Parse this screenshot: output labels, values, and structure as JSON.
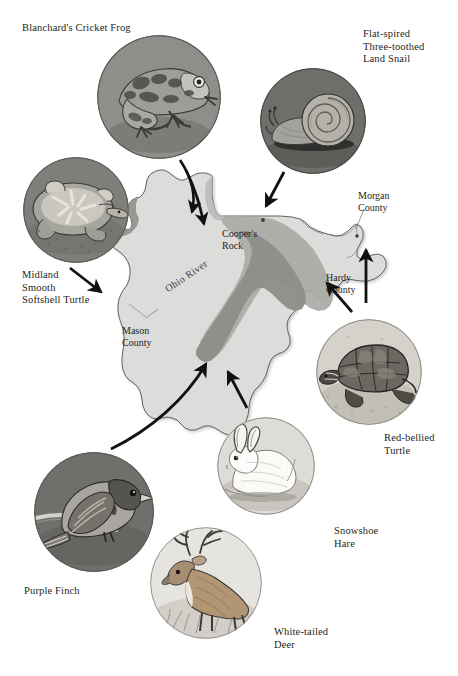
{
  "figure": {
    "background": "#ffffff",
    "width": 458,
    "height": 676
  },
  "map": {
    "name": "West Virginia",
    "fill_lowland": "#dcdcda",
    "fill_highland": "#a9a9a6",
    "fill_highland_core": "#8d8d8a",
    "outline": "#55534f",
    "labels": [
      {
        "id": "ohio-river",
        "text": "Ohio River",
        "x": 163,
        "y": 285,
        "kind": "river"
      },
      {
        "id": "coopers-rock",
        "text": "Cooper's\nRock",
        "x": 222,
        "y": 228,
        "kind": "place"
      },
      {
        "id": "mason-county",
        "text": "Mason\nCounty",
        "x": 122,
        "y": 325,
        "kind": "county"
      },
      {
        "id": "morgan-county",
        "text": "Morgan\nCounty",
        "x": 358,
        "y": 190,
        "kind": "county"
      },
      {
        "id": "hardy-county",
        "text": "Hardy\nCounty",
        "x": 326,
        "y": 272,
        "kind": "county"
      }
    ],
    "point_markers": [
      {
        "id": "coopers-rock-dot",
        "x": 263,
        "y": 220
      },
      {
        "id": "morgan-county-dot",
        "x": 357,
        "y": 236
      }
    ]
  },
  "species": [
    {
      "id": "blanchards-cricket-frog",
      "label": "Blanchard's Cricket Frog",
      "label_x": 22,
      "label_y": 22,
      "icon": "frog-illustration",
      "circle": {
        "cx": 159,
        "cy": 97,
        "r": 62
      },
      "disc_color": "#8e8e8b"
    },
    {
      "id": "flat-spired-three-toothed-land-snail",
      "label": "Flat-spired\nThree-toothed\nLand Snail",
      "label_x": 363,
      "label_y": 28,
      "icon": "snail-illustration",
      "circle": {
        "cx": 313,
        "cy": 121,
        "r": 53
      },
      "disc_color": "#6e6e6b"
    },
    {
      "id": "midland-smooth-softshell-turtle",
      "label": "Midland\nSmooth\nSoftshell Turtle",
      "label_x": 22,
      "label_y": 269,
      "icon": "softshell-turtle-illustration",
      "circle": {
        "cx": 76,
        "cy": 210,
        "r": 53
      },
      "disc_color": "#7e7e7b"
    },
    {
      "id": "red-bellied-turtle",
      "label": "Red-bellied\nTurtle",
      "label_x": 384,
      "label_y": 432,
      "icon": "red-bellied-turtle-illustration",
      "circle": {
        "cx": 369,
        "cy": 372,
        "r": 53
      },
      "disc_color": "#cfcdc6"
    },
    {
      "id": "snowshoe-hare",
      "label": "Snowshoe\nHare",
      "label_x": 334,
      "label_y": 525,
      "icon": "hare-illustration",
      "circle": {
        "cx": 266,
        "cy": 466,
        "r": 49
      },
      "disc_color": "#d8d6d0"
    },
    {
      "id": "purple-finch",
      "label": "Purple Finch",
      "label_x": 24,
      "label_y": 585,
      "icon": "finch-illustration",
      "circle": {
        "cx": 94,
        "cy": 512,
        "r": 60
      },
      "disc_color": "#6f6f6c"
    },
    {
      "id": "white-tailed-deer",
      "label": "White-tailed\nDeer",
      "label_x": 274,
      "label_y": 626,
      "icon": "deer-illustration",
      "circle": {
        "cx": 206,
        "cy": 583,
        "r": 56
      },
      "disc_color": "#e2e0db"
    }
  ],
  "arrows": [
    {
      "id": "arrow-frog-to-map",
      "from": "blanchards-cricket-frog",
      "to": "northern-panhandle"
    },
    {
      "id": "arrow-snail-to-map",
      "from": "flat-spired-three-toothed-land-snail",
      "to": "coopers-rock"
    },
    {
      "id": "arrow-softshell-to-map",
      "from": "midland-smooth-softshell-turtle",
      "to": "mason-county"
    },
    {
      "id": "arrow-redbelly-to-map",
      "from": "red-bellied-turtle",
      "to": "hardy-county"
    },
    {
      "id": "arrow-hardy-to-morgan",
      "from": "hardy-county",
      "to": "morgan-county"
    },
    {
      "id": "arrow-finch-to-map",
      "from": "purple-finch",
      "to": "highlands"
    },
    {
      "id": "arrow-hare-to-map",
      "from": "snowshoe-hare",
      "to": "highlands-south"
    }
  ]
}
